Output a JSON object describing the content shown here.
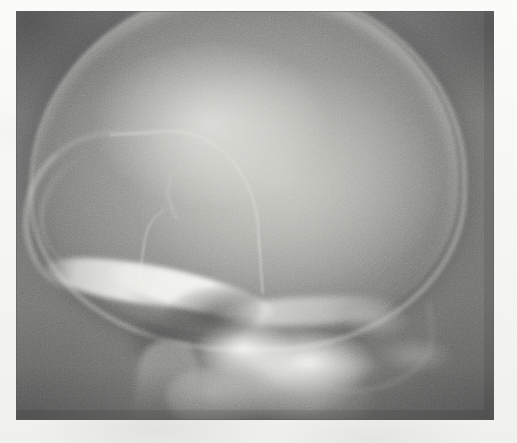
{
  "document": {
    "type": "medical-radiograph",
    "modality": "X-ray",
    "view": "lateral",
    "subject": "skull",
    "caption": "",
    "annotations": [],
    "visible_text": []
  },
  "canvas": {
    "width": 517,
    "height": 443,
    "paper_background": "#f7f7f5"
  },
  "radiograph": {
    "x": 16,
    "y": 11,
    "width": 478,
    "height": 409,
    "background_density": "#6f6f6f",
    "palette": {
      "film_background": "#6f6f6f",
      "soft_tissue": "#8c8c8a",
      "cranial_vault": "#c4c4c0",
      "bone_bright": "#e6e6e2",
      "bone_dense_white": "#fafaf7",
      "air_shadow": "#3c3c3c",
      "vignette_corner": "#4a4a4a"
    },
    "grain": {
      "visible": true,
      "description": "fine film grain / scan noise"
    }
  },
  "anatomy": [
    {
      "name": "cranial-vault",
      "label": "Cranial vault (calvaria)",
      "density": "bright-radiopaque"
    },
    {
      "name": "frontal-bone",
      "label": "Frontal bone anterior curve",
      "density": "bright-radiopaque"
    },
    {
      "name": "coronal-suture",
      "label": "Coronal suture / vascular groove",
      "density": "thin-bright-line"
    },
    {
      "name": "lambdoid-suture",
      "label": "Lambdoid suture region",
      "density": "faint-line"
    },
    {
      "name": "orbital-roof",
      "label": "Orbital roof",
      "density": "bright-radiopaque"
    },
    {
      "name": "sphenoid-ridge",
      "label": "Greater wing of sphenoid ridge",
      "density": "bright-radiopaque"
    },
    {
      "name": "sella-turcica",
      "label": "Sella turcica / sphenoid air shadow",
      "density": "radiolucent-dark"
    },
    {
      "name": "petrous-temporal",
      "label": "Petrous temporal bone",
      "density": "dense-white"
    },
    {
      "name": "mastoid-air-cells",
      "label": "Mastoid air cells",
      "density": "radiolucent-dark"
    },
    {
      "name": "posterior-fossa",
      "label": "Posterior fossa / occipital bone",
      "density": "mottled-grey"
    },
    {
      "name": "facial-skeleton",
      "label": "Facial skeleton / mandibular ramus",
      "density": "mid-grey"
    },
    {
      "name": "cervical-spine",
      "label": "Upper cervical soft tissue shadow",
      "density": "mid-grey"
    }
  ]
}
